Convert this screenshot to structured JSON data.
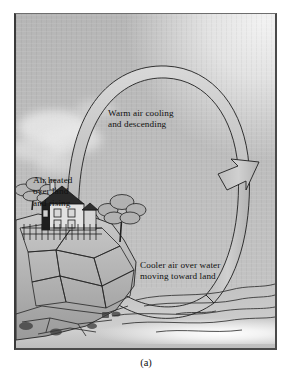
{
  "figure": {
    "caption": "(a)",
    "panel_bg_color": "#bcbcbc",
    "ink_color": "#1a1a1a"
  },
  "scene": {
    "title": "sea-breeze-circulation-diagram",
    "elements": [
      {
        "name": "sun-glow",
        "label": "sun"
      },
      {
        "name": "clouds",
        "label": "clouds"
      },
      {
        "name": "house-on-cliff",
        "label": "house"
      },
      {
        "name": "rocky-cliff",
        "label": "cliff"
      },
      {
        "name": "trees",
        "label": "trees"
      },
      {
        "name": "water",
        "label": "water"
      },
      {
        "name": "circulation-loop-arrow",
        "label": "convection loop"
      }
    ]
  },
  "labels": {
    "warm_air": "Warm air cooling\nand descending",
    "air_heated": "Air heated\nover land\nand rising",
    "cooler_air": "Cooler air over water\nmoving toward land"
  },
  "arrows": {
    "up_arrow_name": "up-arrow-head",
    "down_arrow_name": "down-arrow-head",
    "loop_fill_color": "#c8c8c8",
    "loop_outline_color": "#1f1f1f"
  }
}
